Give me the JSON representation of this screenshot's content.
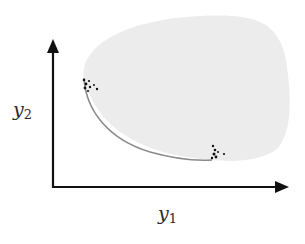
{
  "diagram": {
    "type": "objective-space-feasible-region",
    "axes": {
      "x": {
        "label_base": "y",
        "label_sub": "1"
      },
      "y": {
        "label_base": "y",
        "label_sub": "2"
      }
    },
    "region": {
      "fill_color": "#ececec",
      "front_color": "#8a8a8a"
    },
    "clusters": [
      {
        "name": "upper-left-cluster",
        "points": [
          [
            84,
            80
          ],
          [
            86,
            84
          ],
          [
            89,
            82
          ],
          [
            85,
            88
          ],
          [
            90,
            87
          ],
          [
            94,
            86
          ],
          [
            97,
            90
          ],
          [
            88,
            91
          ]
        ]
      },
      {
        "name": "lower-right-cluster",
        "points": [
          [
            213,
            146
          ],
          [
            215,
            150
          ],
          [
            214,
            154
          ],
          [
            218,
            152
          ],
          [
            216,
            157
          ],
          [
            224,
            154
          ],
          [
            212,
            158
          ]
        ]
      }
    ],
    "colors": {
      "axis": "#111111",
      "points": "#111111",
      "background": "#ffffff"
    }
  }
}
